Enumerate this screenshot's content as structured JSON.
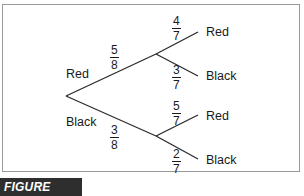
{
  "figure": {
    "caption": "FIGURE 15.11"
  },
  "tree": {
    "first_branch": [
      {
        "outcome": "Red",
        "probability": {
          "numerator": "5",
          "denominator": "8"
        }
      },
      {
        "outcome": "Black",
        "probability": {
          "numerator": "3",
          "denominator": "8"
        }
      }
    ],
    "second_branch_after_red": [
      {
        "outcome": "Red",
        "probability": {
          "numerator": "4",
          "denominator": "7"
        }
      },
      {
        "outcome": "Black",
        "probability": {
          "numerator": "3",
          "denominator": "7"
        }
      }
    ],
    "second_branch_after_black": [
      {
        "outcome": "Red",
        "probability": {
          "numerator": "5",
          "denominator": "7"
        }
      },
      {
        "outcome": "Black",
        "probability": {
          "numerator": "2",
          "denominator": "7"
        }
      }
    ]
  },
  "colors": {
    "line": "#2a2a2a",
    "frame": "#9a9a9a",
    "caption_bg": "#2e2e2e"
  }
}
